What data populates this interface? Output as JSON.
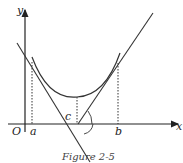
{
  "figure": {
    "caption": "Figure 2-5",
    "axis_labels": {
      "y": "y",
      "x": "x",
      "origin": "O"
    },
    "point_labels": {
      "a": "a",
      "b": "b",
      "c": "c"
    },
    "colors": {
      "stroke": "#333333",
      "background": "#ffffff"
    }
  }
}
